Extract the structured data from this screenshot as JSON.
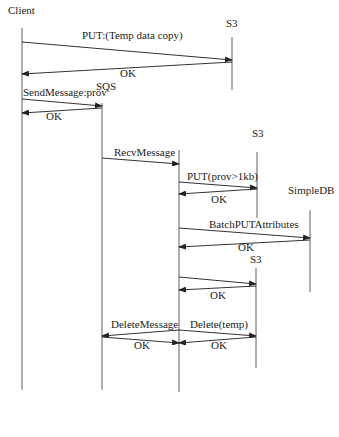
{
  "participants": [
    {
      "id": "client",
      "label": "Client",
      "x": 22,
      "label_x": 8,
      "label_y": 14,
      "y1": 28,
      "y2": 390
    },
    {
      "id": "s3_a",
      "label": "S3",
      "x": 232,
      "label_x": 226,
      "label_y": 27,
      "y1": 37,
      "y2": 90
    },
    {
      "id": "sqs",
      "label": "SQS",
      "x": 102,
      "label_x": 96,
      "label_y": 90,
      "y1": 103,
      "y2": 390
    },
    {
      "id": "worker",
      "label": "",
      "x": 179,
      "label_x": 0,
      "label_y": 0,
      "y1": 150,
      "y2": 392
    },
    {
      "id": "s3_b",
      "label": "S3",
      "x": 257,
      "label_x": 252,
      "label_y": 137,
      "y1": 152,
      "y2": 218
    },
    {
      "id": "simpledb",
      "label": "SimpleDB",
      "x": 310,
      "label_x": 288,
      "label_y": 194,
      "y1": 210,
      "y2": 292
    },
    {
      "id": "s3_c",
      "label": "S3",
      "x": 256,
      "label_x": 250,
      "label_y": 263,
      "y1": 268,
      "y2": 368
    }
  ],
  "messages": [
    {
      "label": "PUT:(Temp data copy)",
      "from": "client",
      "to": "s3_a",
      "x1": 22,
      "y1": 42,
      "x2": 232,
      "y2": 60,
      "label_x": 82,
      "label_y": 39
    },
    {
      "label": "OK",
      "from": "s3_a",
      "to": "client",
      "x1": 232,
      "y1": 62,
      "x2": 22,
      "y2": 74,
      "label_x": 120,
      "label_y": 77
    },
    {
      "label": "SendMessage:prov",
      "from": "client",
      "to": "sqs",
      "x1": 22,
      "y1": 99,
      "x2": 102,
      "y2": 106,
      "label_x": 23,
      "label_y": 96
    },
    {
      "label": "OK",
      "from": "sqs",
      "to": "client",
      "x1": 102,
      "y1": 108,
      "x2": 22,
      "y2": 113,
      "label_x": 46,
      "label_y": 120
    },
    {
      "label": "RecvMessage",
      "from": "client",
      "to": "sqs_recv",
      "x1": 102,
      "y1": 158,
      "x2": 179,
      "y2": 164,
      "label_x": 114,
      "label_y": 156
    },
    {
      "label": "PUT(prov>1kb)",
      "from": "worker",
      "to": "s3_b",
      "x1": 179,
      "y1": 182,
      "x2": 257,
      "y2": 188,
      "label_x": 187,
      "label_y": 180
    },
    {
      "label": "OK",
      "from": "s3_b",
      "to": "worker",
      "x1": 257,
      "y1": 189,
      "x2": 179,
      "y2": 194,
      "label_x": 211,
      "label_y": 203
    },
    {
      "label": "BatchPUTAttributes",
      "from": "worker",
      "to": "simpledb",
      "x1": 179,
      "y1": 228,
      "x2": 310,
      "y2": 238,
      "label_x": 209,
      "label_y": 228
    },
    {
      "label": "OK",
      "from": "simpledb",
      "to": "worker",
      "x1": 310,
      "y1": 240,
      "x2": 179,
      "y2": 247,
      "label_x": 238,
      "label_y": 251
    },
    {
      "label": "",
      "from": "worker",
      "to": "s3_c",
      "x1": 179,
      "y1": 277,
      "x2": 256,
      "y2": 284,
      "label_x": 0,
      "label_y": 0
    },
    {
      "label": "OK",
      "from": "s3_c",
      "to": "worker",
      "x1": 256,
      "y1": 286,
      "x2": 179,
      "y2": 290,
      "label_x": 210,
      "label_y": 299
    },
    {
      "label": "DeleteMessage",
      "from": "worker",
      "to": "sqs",
      "x1": 179,
      "y1": 330,
      "x2": 102,
      "y2": 336,
      "label_x": 111,
      "label_y": 328
    },
    {
      "label": "OK",
      "from": "sqs",
      "to": "worker",
      "x1": 102,
      "y1": 337,
      "x2": 179,
      "y2": 343,
      "label_x": 134,
      "label_y": 349
    },
    {
      "label": "Delete(temp)",
      "from": "worker",
      "to": "s3_c",
      "x1": 179,
      "y1": 330,
      "x2": 256,
      "y2": 336,
      "label_x": 190,
      "label_y": 328
    },
    {
      "label": "OK",
      "from": "s3_c",
      "to": "worker",
      "x1": 256,
      "y1": 337,
      "x2": 179,
      "y2": 343,
      "label_x": 211,
      "label_y": 349
    }
  ]
}
